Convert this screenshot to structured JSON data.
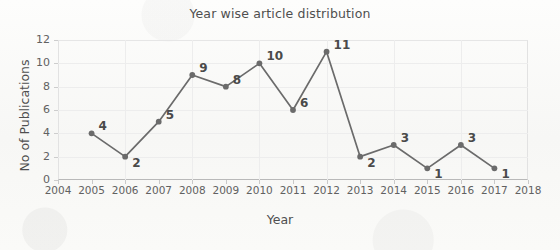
{
  "chart_data": {
    "type": "line",
    "title": "Year wise article distribution",
    "xlabel": "Year",
    "ylabel": "No of Publications",
    "x": [
      2005,
      2006,
      2007,
      2008,
      2009,
      2010,
      2011,
      2012,
      2013,
      2014,
      2015,
      2016,
      2017
    ],
    "values": [
      4,
      2,
      5,
      9,
      8,
      10,
      6,
      11,
      2,
      3,
      1,
      3,
      1
    ],
    "point_labels": [
      "4",
      "2",
      "5",
      "9",
      "8",
      "10",
      "6",
      "11",
      "2",
      "3",
      "1",
      "3",
      "1"
    ],
    "xlim": [
      2004,
      2018
    ],
    "ylim": [
      0,
      12
    ],
    "xticks": [
      "2004",
      "2005",
      "2006",
      "2007",
      "2008",
      "2009",
      "2010",
      "2011",
      "2012",
      "2013",
      "2014",
      "2015",
      "2016",
      "2017",
      "2018"
    ],
    "yticks": [
      "0",
      "2",
      "4",
      "6",
      "8",
      "10",
      "12"
    ],
    "grid": true,
    "legend": false,
    "series_color": "#6b6b6b",
    "marker": "circle",
    "data_labels_shown": true
  },
  "background_text": {
    "line_top": "",
    "line_mid": "",
    "line_bottom": "",
    "line_bottom2": ""
  }
}
